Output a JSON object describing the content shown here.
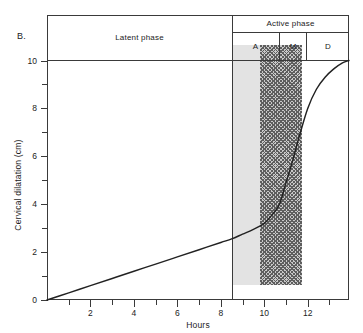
{
  "panel": {
    "letter": "B."
  },
  "axes": {
    "x": {
      "title": "Hours",
      "labels": [
        "2",
        "4",
        "6",
        "8",
        "10",
        "12"
      ],
      "label_values": [
        2,
        4,
        6,
        8,
        10,
        12
      ],
      "minor_values": [
        1,
        3,
        5,
        7,
        9,
        11,
        13
      ],
      "range": [
        0,
        13.9
      ]
    },
    "y": {
      "title": "Cervical dilatation (cm)",
      "labels": [
        "0",
        "2",
        "4",
        "6",
        "8",
        "10"
      ],
      "label_values": [
        0,
        2,
        4,
        6,
        8,
        10
      ],
      "minor_values": [
        1,
        3,
        5,
        7,
        9
      ],
      "range": [
        0,
        11.9
      ]
    }
  },
  "phases": {
    "latent_label": "Latent phase",
    "active_label": "Active phase",
    "sub_phases": [
      {
        "key": "A",
        "label": "A"
      },
      {
        "key": "M",
        "label": "M"
      },
      {
        "key": "D",
        "label": "D"
      }
    ]
  },
  "colors": {
    "line": "#222222",
    "frame": "#3a3a3a",
    "band_m_fill": "#e3e3e3",
    "band_d_hatch": "#5e5e5e",
    "band_d_fill": "#c9c9c9",
    "background": "#ffffff"
  },
  "chart_data": {
    "type": "line",
    "title": "",
    "xlabel": "Hours",
    "ylabel": "Cervical dilatation (cm)",
    "xlim": [
      0,
      13.9
    ],
    "ylim": [
      0,
      11.9
    ],
    "grid": false,
    "legend": null,
    "annotations": [
      {
        "text": "B.",
        "role": "panel-letter"
      },
      {
        "text": "Latent phase",
        "x_range": [
          0,
          8.5
        ],
        "role": "phase-band-label"
      },
      {
        "text": "Active phase",
        "x_range": [
          8.5,
          13.9
        ],
        "role": "phase-band-label"
      },
      {
        "text": "A",
        "x_range": [
          8.5,
          10.7
        ],
        "role": "sub-phase-label",
        "meaning": "acceleration"
      },
      {
        "text": "M",
        "x_range": [
          10.7,
          12.0
        ],
        "role": "sub-phase-label",
        "meaning": "maximum slope"
      },
      {
        "text": "D",
        "x_range": [
          12.0,
          13.9
        ],
        "role": "sub-phase-label",
        "meaning": "deceleration"
      },
      {
        "text": "10",
        "y": 10,
        "role": "reference-line"
      }
    ],
    "shaded_regions": [
      {
        "label": "M",
        "x_range": [
          10.7,
          12.0
        ],
        "fill": "light-gray",
        "y_range": [
          0,
          10
        ]
      },
      {
        "label": "D",
        "x_range": [
          12.0,
          13.9
        ],
        "fill": "dark-crosshatch",
        "y_range": [
          0,
          10
        ]
      }
    ],
    "reference_lines": [
      {
        "orientation": "horizontal",
        "value": 10
      },
      {
        "orientation": "vertical",
        "value": 8.5
      }
    ],
    "series": [
      {
        "name": "Cervical dilatation",
        "x": [
          0,
          1,
          2,
          3,
          4,
          5,
          6,
          7,
          8,
          8.5,
          9,
          9.5,
          10,
          10.4,
          10.7,
          11,
          11.3,
          11.6,
          12,
          12.4,
          12.8,
          13.2,
          13.6,
          13.9
        ],
        "y": [
          0,
          0.3,
          0.6,
          0.9,
          1.2,
          1.5,
          1.8,
          2.1,
          2.4,
          2.55,
          2.75,
          2.95,
          3.2,
          3.6,
          4.0,
          4.9,
          5.8,
          6.8,
          8.0,
          8.8,
          9.3,
          9.65,
          9.9,
          10.0
        ]
      }
    ]
  }
}
